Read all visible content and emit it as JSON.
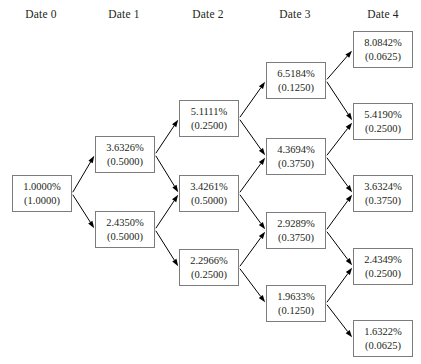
{
  "diagram": {
    "type": "binomial-tree",
    "columns": [
      {
        "label": "Date 0",
        "x": 41
      },
      {
        "label": "Date 1",
        "x": 124
      },
      {
        "label": "Date 2",
        "x": 208
      },
      {
        "label": "Date 3",
        "x": 295
      },
      {
        "label": "Date 4",
        "x": 383
      }
    ],
    "node_geometry": {
      "width": 60,
      "height": 37
    },
    "colors": {
      "border": "#7c7c7c",
      "text": "#231f20",
      "edge": "#000000",
      "background": "#ffffff"
    },
    "nodes": [
      {
        "id": "n0_0",
        "date": 0,
        "rate": "1.0000%",
        "prob": "(1.0000)",
        "x": 12,
        "y": 175
      },
      {
        "id": "n1_0",
        "date": 1,
        "rate": "3.6326%",
        "prob": "(0.5000)",
        "x": 95,
        "y": 136
      },
      {
        "id": "n1_1",
        "date": 1,
        "rate": "2.4350%",
        "prob": "(0.5000)",
        "x": 95,
        "y": 211
      },
      {
        "id": "n2_0",
        "date": 2,
        "rate": "5.1111%",
        "prob": "(0.2500)",
        "x": 179,
        "y": 100
      },
      {
        "id": "n2_1",
        "date": 2,
        "rate": "3.4261%",
        "prob": "(0.5000)",
        "x": 179,
        "y": 175
      },
      {
        "id": "n2_2",
        "date": 2,
        "rate": "2.2966%",
        "prob": "(0.2500)",
        "x": 179,
        "y": 249
      },
      {
        "id": "n3_0",
        "date": 3,
        "rate": "6.5184%",
        "prob": "(0.1250)",
        "x": 266,
        "y": 62
      },
      {
        "id": "n3_1",
        "date": 3,
        "rate": "4.3694%",
        "prob": "(0.3750)",
        "x": 266,
        "y": 138
      },
      {
        "id": "n3_2",
        "date": 3,
        "rate": "2.9289%",
        "prob": "(0.3750)",
        "x": 266,
        "y": 212
      },
      {
        "id": "n3_3",
        "date": 3,
        "rate": "1.9633%",
        "prob": "(0.1250)",
        "x": 266,
        "y": 285
      },
      {
        "id": "n4_0",
        "date": 4,
        "rate": "8.0842%",
        "prob": "(0.0625)",
        "x": 353,
        "y": 31
      },
      {
        "id": "n4_1",
        "date": 4,
        "rate": "5.4190%",
        "prob": "(0.2500)",
        "x": 353,
        "y": 103
      },
      {
        "id": "n4_2",
        "date": 4,
        "rate": "3.6324%",
        "prob": "(0.3750)",
        "x": 353,
        "y": 175
      },
      {
        "id": "n4_3",
        "date": 4,
        "rate": "2.4349%",
        "prob": "(0.2500)",
        "x": 353,
        "y": 248
      },
      {
        "id": "n4_4",
        "date": 4,
        "rate": "1.6322%",
        "prob": "(0.0625)",
        "x": 353,
        "y": 320
      }
    ],
    "edges": [
      {
        "from": "n0_0",
        "to": "n1_0"
      },
      {
        "from": "n0_0",
        "to": "n1_1"
      },
      {
        "from": "n1_0",
        "to": "n2_0"
      },
      {
        "from": "n1_0",
        "to": "n2_1"
      },
      {
        "from": "n1_1",
        "to": "n2_1"
      },
      {
        "from": "n1_1",
        "to": "n2_2"
      },
      {
        "from": "n2_0",
        "to": "n3_0"
      },
      {
        "from": "n2_0",
        "to": "n3_1"
      },
      {
        "from": "n2_1",
        "to": "n3_1"
      },
      {
        "from": "n2_1",
        "to": "n3_2"
      },
      {
        "from": "n2_2",
        "to": "n3_2"
      },
      {
        "from": "n2_2",
        "to": "n3_3"
      },
      {
        "from": "n3_0",
        "to": "n4_0"
      },
      {
        "from": "n3_0",
        "to": "n4_1"
      },
      {
        "from": "n3_1",
        "to": "n4_1"
      },
      {
        "from": "n3_1",
        "to": "n4_2"
      },
      {
        "from": "n3_2",
        "to": "n4_2"
      },
      {
        "from": "n3_2",
        "to": "n4_3"
      },
      {
        "from": "n3_3",
        "to": "n4_3"
      },
      {
        "from": "n3_3",
        "to": "n4_4"
      }
    ]
  }
}
